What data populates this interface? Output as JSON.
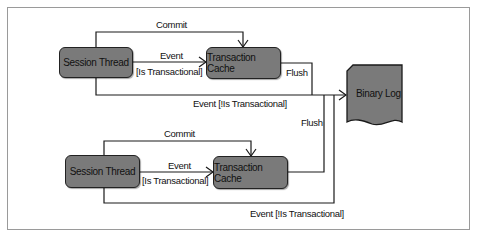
{
  "diagram": {
    "title": "",
    "top_group": {
      "session_thread": "Session Thread",
      "transaction_cache": "Transaction Cache",
      "commit_label": "Commit",
      "event_label": "Event",
      "is_transactional_label": "[Is Transactional]",
      "flush_label": "Flush",
      "event_not_transactional_label": "Event [!Is Transactional]"
    },
    "bottom_group": {
      "session_thread": "Session Thread",
      "transaction_cache": "Transaction Cache",
      "commit_label": "Commit",
      "event_label": "Event",
      "is_transactional_label": "[Is Transactional]",
      "flush_label": "Flush",
      "event_not_transactional_label": "Event [!Is Transactional]"
    },
    "binary_log": "Binary Log",
    "colors": {
      "node_fill": "#7a7a7a",
      "line": "#1a1a1a",
      "frame": "#9a9a9a"
    }
  }
}
